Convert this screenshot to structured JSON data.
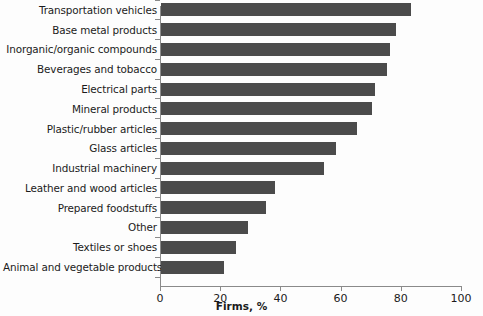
{
  "chart_data": {
    "type": "bar",
    "orientation": "horizontal",
    "title": "",
    "xlabel": "Firms, %",
    "ylabel": "",
    "xlim": [
      0,
      100
    ],
    "xticks": [
      0,
      20,
      40,
      60,
      80,
      100
    ],
    "grid": false,
    "legend": null,
    "bar_color": "#4b4b4b",
    "axis_color": "#8a8a8a",
    "categories": [
      "Transportation vehicles",
      "Base metal products",
      "Inorganic/organic compounds",
      "Beverages and tobacco",
      "Electrical parts",
      "Mineral products",
      "Plastic/rubber articles",
      "Glass articles",
      "Industrial machinery",
      "Leather and wood articles",
      "Prepared foodstuffs",
      "Other",
      "Textiles or shoes",
      "Animal and vegetable products"
    ],
    "values": [
      83,
      78,
      76,
      75,
      71,
      70,
      65,
      58,
      54,
      38,
      35,
      29,
      25,
      21
    ]
  },
  "axis": {
    "x_title": "Firms, %",
    "tick_labels": [
      "0",
      "20",
      "40",
      "60",
      "80",
      "100"
    ]
  }
}
